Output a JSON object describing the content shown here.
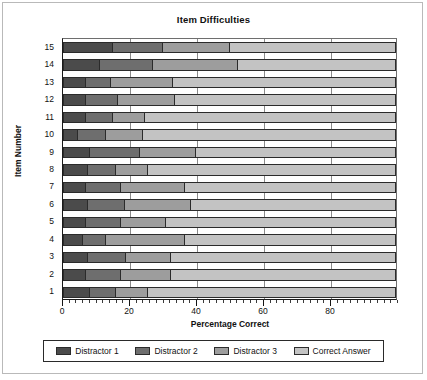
{
  "figure": {
    "title": "Item Difficulties"
  },
  "axes": {
    "x_title": "Percentage Correct",
    "y_title": "Item Number",
    "x_ticks": [
      "0",
      "20",
      "40",
      "60",
      "80"
    ],
    "y_ticks": [
      "15",
      "14",
      "13",
      "12",
      "11",
      "10",
      "9",
      "8",
      "7",
      "6",
      "5",
      "4",
      "3",
      "2",
      "1"
    ]
  },
  "legend": {
    "items": [
      {
        "label": "Distractor 1",
        "swatch": "#4b4b4b",
        "key": "d1"
      },
      {
        "label": "Distractor 2",
        "swatch": "#6e6e6e",
        "key": "d2"
      },
      {
        "label": "Distractor 3",
        "swatch": "#9d9d9d",
        "key": "d3"
      },
      {
        "label": "Correct Answer",
        "swatch": "#c3c3c3",
        "key": "ca"
      }
    ]
  },
  "colors": {
    "distractor_1": "#4b4b4b",
    "distractor_2": "#6e6e6e",
    "distractor_3": "#9d9d9d",
    "correct_answer": "#c3c3c3",
    "axis": "#1a1a1a",
    "gridline": "#8a8a8a",
    "background": "#ffffff"
  },
  "chart_data": {
    "type": "bar",
    "orientation": "horizontal",
    "stacked": true,
    "title": "Item Difficulties",
    "xlabel": "Percentage Correct",
    "ylabel": "Item Number",
    "xlim": [
      0,
      100
    ],
    "xticks": [
      0,
      20,
      40,
      60,
      80
    ],
    "grid": true,
    "legend_position": "bottom",
    "categories": [
      "1",
      "2",
      "3",
      "4",
      "5",
      "6",
      "7",
      "8",
      "9",
      "10",
      "11",
      "12",
      "13",
      "14",
      "15"
    ],
    "series": [
      {
        "name": "Distractor 1",
        "color": "#4b4b4b",
        "values": [
          8.0,
          7.0,
          7.5,
          6.0,
          7.0,
          7.5,
          7.0,
          7.5,
          8.0,
          4.5,
          7.0,
          7.0,
          7.0,
          11.0,
          15.0
        ]
      },
      {
        "name": "Distractor 2",
        "color": "#6e6e6e",
        "values": [
          8.0,
          10.5,
          11.5,
          7.0,
          10.5,
          11.0,
          10.5,
          8.5,
          15.0,
          8.5,
          8.0,
          9.5,
          7.5,
          16.0,
          15.0
        ]
      },
      {
        "name": "Distractor 3",
        "color": "#9d9d9d",
        "values": [
          9.5,
          15.0,
          13.5,
          23.5,
          13.5,
          20.0,
          19.0,
          9.5,
          17.0,
          11.0,
          9.5,
          17.0,
          18.5,
          25.5,
          20.0
        ]
      },
      {
        "name": "Correct Answer",
        "color": "#c3c3c3",
        "values": [
          74.5,
          67.5,
          67.5,
          63.5,
          69.0,
          61.5,
          63.5,
          74.5,
          60.0,
          76.0,
          75.5,
          66.5,
          67.0,
          47.5,
          50.0
        ]
      }
    ],
    "cumulative_boundaries": [
      {
        "item": "1",
        "d1_end": 8.0,
        "d2_end": 16.0,
        "d3_end": 25.5,
        "total": 100
      },
      {
        "item": "2",
        "d1_end": 7.0,
        "d2_end": 17.5,
        "d3_end": 32.5,
        "total": 100
      },
      {
        "item": "3",
        "d1_end": 7.5,
        "d2_end": 19.0,
        "d3_end": 32.5,
        "total": 100
      },
      {
        "item": "4",
        "d1_end": 6.0,
        "d2_end": 13.0,
        "d3_end": 36.5,
        "total": 100
      },
      {
        "item": "5",
        "d1_end": 7.0,
        "d2_end": 17.5,
        "d3_end": 31.0,
        "total": 100
      },
      {
        "item": "6",
        "d1_end": 7.5,
        "d2_end": 18.5,
        "d3_end": 38.5,
        "total": 100
      },
      {
        "item": "7",
        "d1_end": 7.0,
        "d2_end": 17.5,
        "d3_end": 36.5,
        "total": 100
      },
      {
        "item": "8",
        "d1_end": 7.5,
        "d2_end": 16.0,
        "d3_end": 25.5,
        "total": 100
      },
      {
        "item": "9",
        "d1_end": 8.0,
        "d2_end": 23.0,
        "d3_end": 40.0,
        "total": 100
      },
      {
        "item": "10",
        "d1_end": 4.5,
        "d2_end": 13.0,
        "d3_end": 24.0,
        "total": 100
      },
      {
        "item": "11",
        "d1_end": 7.0,
        "d2_end": 15.0,
        "d3_end": 24.5,
        "total": 100
      },
      {
        "item": "12",
        "d1_end": 7.0,
        "d2_end": 16.5,
        "d3_end": 33.5,
        "total": 100
      },
      {
        "item": "13",
        "d1_end": 7.0,
        "d2_end": 14.5,
        "d3_end": 33.0,
        "total": 100
      },
      {
        "item": "14",
        "d1_end": 11.0,
        "d2_end": 27.0,
        "d3_end": 52.5,
        "total": 100
      },
      {
        "item": "15",
        "d1_end": 15.0,
        "d2_end": 30.0,
        "d3_end": 50.0,
        "total": 100
      }
    ]
  }
}
